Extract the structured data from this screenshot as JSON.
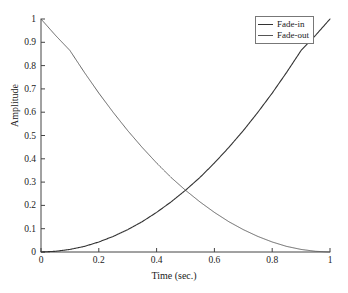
{
  "chart_data": {
    "type": "line",
    "title": "",
    "xlabel": "Time (sec.)",
    "ylabel": "Amplitude",
    "xlim": [
      0,
      1
    ],
    "ylim": [
      0,
      1
    ],
    "grid": false,
    "legend_position": "top-right",
    "xticks": [
      "0",
      "0.2",
      "0.4",
      "0.6",
      "0.8",
      "1"
    ],
    "xtick_values": [
      0,
      0.2,
      0.4,
      0.6,
      0.8,
      1
    ],
    "yticks": [
      "0",
      "0.1",
      "0.2",
      "0.3",
      "0.4",
      "0.5",
      "0.6",
      "0.7",
      "0.8",
      "0.9",
      "1"
    ],
    "ytick_values": [
      0,
      0.1,
      0.2,
      0.3,
      0.4,
      0.5,
      0.6,
      0.7,
      0.8,
      0.9,
      1
    ],
    "x": [
      0,
      0.05,
      0.1,
      0.15,
      0.2,
      0.25,
      0.3,
      0.35,
      0.4,
      0.45,
      0.5,
      0.55,
      0.6,
      0.65,
      0.7,
      0.75,
      0.8,
      0.85,
      0.9,
      0.95,
      1
    ],
    "series": [
      {
        "name": "Fade-in",
        "color": "#333333",
        "values": [
          0,
          0.003,
          0.011,
          0.024,
          0.043,
          0.067,
          0.096,
          0.13,
          0.17,
          0.215,
          0.265,
          0.32,
          0.382,
          0.449,
          0.521,
          0.599,
          0.682,
          0.771,
          0.865,
          0.93,
          1
        ]
      },
      {
        "name": "Fade-out",
        "color": "#555555",
        "values": [
          1,
          0.93,
          0.865,
          0.771,
          0.682,
          0.599,
          0.521,
          0.449,
          0.382,
          0.32,
          0.265,
          0.215,
          0.17,
          0.13,
          0.096,
          0.067,
          0.043,
          0.024,
          0.011,
          0.003,
          0
        ]
      }
    ],
    "crossing_point": {
      "x": 0.5,
      "y": 0.26
    }
  },
  "legend": {
    "items": [
      {
        "label": "Fade-in"
      },
      {
        "label": "Fade-out"
      }
    ]
  },
  "axes": {
    "x_title": "Time (sec.)",
    "y_title": "Amplitude"
  }
}
